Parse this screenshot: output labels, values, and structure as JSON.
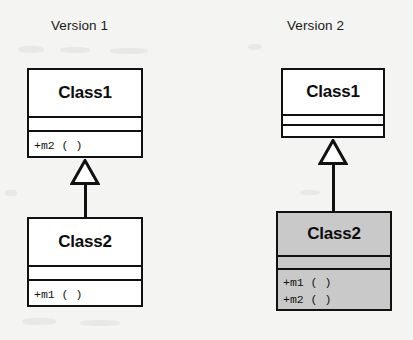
{
  "figure": {
    "type": "uml-class-diagram",
    "background_color": "#f4f4f2",
    "line_color": "#111111",
    "shaded_fill": "#c9c9c9",
    "plain_fill": "#ffffff"
  },
  "panels": [
    {
      "id": "version-1",
      "title": "Version 1",
      "classes": [
        {
          "id": "v1-class1",
          "name": "Class1",
          "shaded": false,
          "attributes": [],
          "operations": [
            "+m2 ( )"
          ]
        },
        {
          "id": "v1-class2",
          "name": "Class2",
          "shaded": false,
          "attributes": [],
          "operations": [
            "+m1 ( )"
          ]
        }
      ],
      "relationships": [
        {
          "type": "generalization",
          "source": "Class2",
          "target": "Class1",
          "arrow": "hollow-triangle"
        }
      ]
    },
    {
      "id": "version-2",
      "title": "Version 2",
      "classes": [
        {
          "id": "v2-class1",
          "name": "Class1",
          "shaded": false,
          "attributes": [],
          "operations": []
        },
        {
          "id": "v2-class2",
          "name": "Class2",
          "shaded": true,
          "attributes": [],
          "operations": [
            "+m1 ( )",
            "+m2 ( )"
          ]
        }
      ],
      "relationships": [
        {
          "type": "generalization",
          "source": "Class2",
          "target": "Class1",
          "arrow": "hollow-triangle"
        }
      ]
    }
  ]
}
